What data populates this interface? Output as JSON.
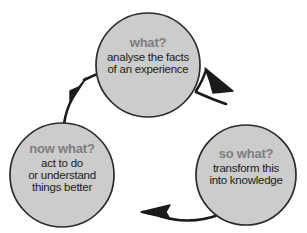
{
  "diagram": {
    "type": "cycle",
    "direction": "clockwise",
    "background_color": "#ffffff",
    "node_fill_color": "#cccccc",
    "node_stroke_color": "#2b2b2b",
    "heading_color": "#7d7d7d",
    "body_text_color": "#1b1b1b",
    "arrow_color": "#1a1a1a",
    "nodes": [
      {
        "id": "what",
        "heading": "what?",
        "lines": [
          "analyse the facts",
          "of an experience"
        ],
        "center_x": 148,
        "center_y": 65,
        "radius": 52
      },
      {
        "id": "so-what",
        "heading": "so what?",
        "lines": [
          "transform this",
          "into knowledge"
        ],
        "center_x": 246,
        "center_y": 175,
        "radius": 50
      },
      {
        "id": "now-what",
        "heading": "now what?",
        "lines": [
          "act to do",
          "or understand",
          "things better"
        ],
        "center_x": 62,
        "center_y": 175,
        "radius": 52
      }
    ],
    "arrows": [
      {
        "id": "what-to-so-what",
        "from": "what",
        "to": "so-what"
      },
      {
        "id": "so-what-to-now-what",
        "from": "so-what",
        "to": "now-what"
      },
      {
        "id": "now-what-to-what",
        "from": "now-what",
        "to": "what"
      }
    ]
  }
}
